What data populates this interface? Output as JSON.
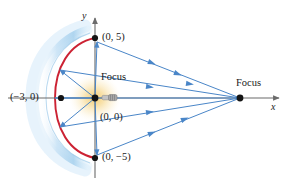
{
  "figure": {
    "type": "geometry-diagram",
    "canvas": {
      "width": 287,
      "height": 184,
      "background": "#ffffff"
    }
  },
  "axes": {
    "x_label": "x",
    "y_label": "y",
    "x_axis_color": "#6b6b6b",
    "y_axis_color": "#6b6b6b",
    "origin_px": {
      "x": 95,
      "y": 98
    },
    "x_axis_from_px": 8,
    "x_axis_to_px": 279,
    "y_axis_from_px": 18,
    "y_axis_to_px": 178
  },
  "labels": {
    "vertex_left": "(−3, 0)",
    "top_point": "(0, 5)",
    "origin_point": "(0, 0)",
    "bottom_point": "(0, −5)",
    "focus_left": "Focus",
    "focus_right": "Focus"
  },
  "points": [
    {
      "name": "vertex-left",
      "label": "(−3, 0)",
      "value": [
        -3,
        0
      ],
      "px": {
        "x": 61,
        "y": 98
      }
    },
    {
      "name": "co-vertex-top",
      "label": "(0, 5)",
      "value": [
        0,
        5
      ],
      "px": {
        "x": 95,
        "y": 38
      }
    },
    {
      "name": "focus-origin",
      "label": "(0, 0)",
      "value": [
        0,
        0
      ],
      "px": {
        "x": 95,
        "y": 98
      }
    },
    {
      "name": "co-vertex-bottom",
      "label": "(0, −5)",
      "value": [
        0,
        -5
      ],
      "px": {
        "x": 95,
        "y": 158
      }
    },
    {
      "name": "focus-right",
      "label": "Focus",
      "px": {
        "x": 240,
        "y": 98
      }
    }
  ],
  "colors": {
    "mirror_band": "#bfdcf2",
    "mirror_band_edge": "#8ec4e8",
    "mirror_curve": "#cc2233",
    "ray": "#4a86c8",
    "axis": "#6b6b6b",
    "point": "#141414",
    "glow_inner": "#f7d98a",
    "glow_outer": "#f9e7bb",
    "bulb_body": "#9a9a9a",
    "bulb_tip": "#d8d8d8",
    "text": "#1a1a1a"
  },
  "rays": {
    "count_outgoing": 5,
    "count_reflected": 5,
    "arrowheads_per_reflected_ray": 1,
    "description": "Rays leave the left focus at the origin, strike the elliptical mirror, and reflect to converge at the right focus."
  }
}
